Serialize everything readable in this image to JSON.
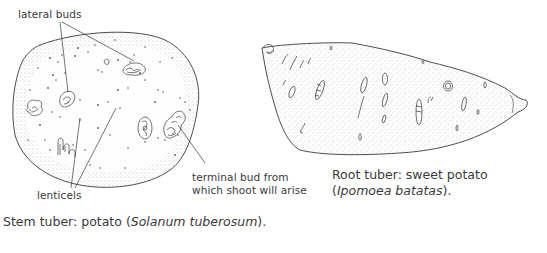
{
  "stem_tuber": {
    "labels": {
      "lateral_buds": "lateral buds",
      "lenticels": "lenticels",
      "terminal_bud_line1": "terminal bud from",
      "terminal_bud_line2": "which shoot will arise"
    },
    "caption": {
      "prefix": "Stem tuber: potato (",
      "species": "Solanum tuberosum",
      "suffix": ")."
    }
  },
  "root_tuber": {
    "caption": {
      "line1": "Root tuber: sweet potato",
      "open": "(",
      "species": "Ipomoea batatas",
      "suffix": ")."
    }
  },
  "colors": {
    "ink": "#3a3a3a",
    "stipple": "#9a9a9a",
    "background": "#ffffff"
  }
}
